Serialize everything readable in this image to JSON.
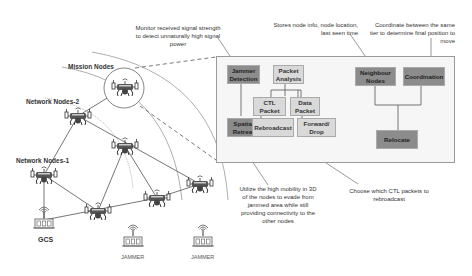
{
  "diagram": {
    "tiers": {
      "mission": "Mission Nodes",
      "network2": "Network Nodes-2",
      "network1": "Network Nodes-1"
    },
    "ground": {
      "gcs": "GCS",
      "jammer1": "JAMMER",
      "jammer2": "JAMMER"
    },
    "blocks": {
      "jammer_detection": "Jammer Detection",
      "packet_analysis": "Packet Analysis",
      "neighbour_nodes": "Neighbour Nodes",
      "coordination": "Coordination",
      "ctl_packet": "CTL Packet",
      "data_packet": "Data Packet",
      "spatial_retreat": "Spatial Retreat",
      "rebroadcast": "Rebroadcast",
      "forward_drop": "Forward/ Drop",
      "relocate": "Relocate"
    },
    "annotations": {
      "monitor": "Monitor received signal strength to detect unnaturally high signal power",
      "stores": "Stores node info, node location, last seen time",
      "coordinate": "Coordinate between the same tier to determine final position to move",
      "utilize": "Utilize the high mobility in 3D of the nodes to evade from jammed area while still providing connectivity to the other nodes",
      "choose": "Choose which CTL packets to rebroadcast"
    },
    "colors": {
      "dark_block": "#8c8c8c",
      "light_block": "#d9d9d9",
      "panel_bg": "#f6f6f6"
    }
  }
}
